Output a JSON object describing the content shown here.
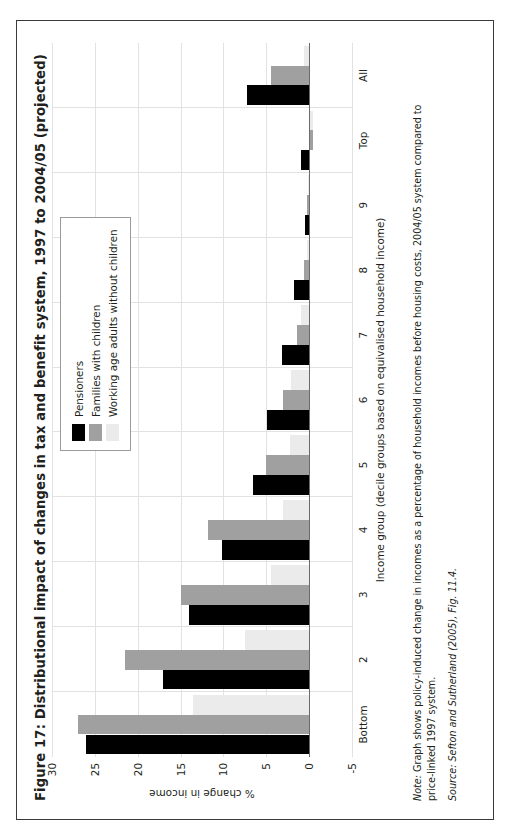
{
  "figure": {
    "title": "Figure 17: Distributional impact of changes in tax and benefit system, 1997 to 2004/05 (projected)",
    "note_lead": "Note:",
    "note_text": " Graph shows policy-induced change in incomes as a percentage of household incomes before housing costs, 2004/05 system compared to price-linked 1997 system.",
    "source": "Source: Sefton and Sutherland (2005), Fig. 11.4."
  },
  "colors": {
    "pensioners": "#000000",
    "families": "#a0a0a0",
    "workingage": "#ebebeb",
    "grid": "#e2e2e2",
    "zeroline": "#6b6b6b",
    "border": "#3a3a3a",
    "text": "#231f20"
  },
  "legend": {
    "position": "top-right-inside",
    "items": [
      {
        "label": "Pensioners",
        "key": "pensioners"
      },
      {
        "label": "Families with children",
        "key": "families"
      },
      {
        "label": "Working age adults without children",
        "key": "workingage"
      }
    ]
  },
  "chart_data": {
    "type": "bar",
    "title": "Figure 17: Distributional impact of changes in tax and benefit system, 1997 to 2004/05 (projected)",
    "xlabel": "Income group (decile groups based on equivalised household income)",
    "ylabel": "% change in income",
    "ylim": [
      -5,
      30
    ],
    "yticks": [
      -5,
      0,
      5,
      10,
      15,
      20,
      25,
      30
    ],
    "grid": true,
    "orientation": "vertical",
    "categories": [
      "Bottom",
      "2",
      "3",
      "4",
      "5",
      "6",
      "7",
      "8",
      "9",
      "Top",
      "All"
    ],
    "series": [
      {
        "name": "Pensioners",
        "color": "#000000",
        "values": [
          26.0,
          17.0,
          14.0,
          10.2,
          6.6,
          4.9,
          3.2,
          1.8,
          0.5,
          0.9,
          7.2
        ]
      },
      {
        "name": "Families with children",
        "color": "#a0a0a0",
        "values": [
          27.0,
          21.5,
          15.0,
          11.8,
          5.0,
          3.1,
          1.4,
          0.6,
          0.2,
          -0.5,
          4.5
        ]
      },
      {
        "name": "Working age adults without children",
        "color": "#ebebeb",
        "values": [
          13.5,
          7.5,
          4.5,
          3.0,
          2.2,
          2.1,
          0.9,
          0.3,
          0.1,
          -0.4,
          0.6
        ]
      }
    ]
  }
}
